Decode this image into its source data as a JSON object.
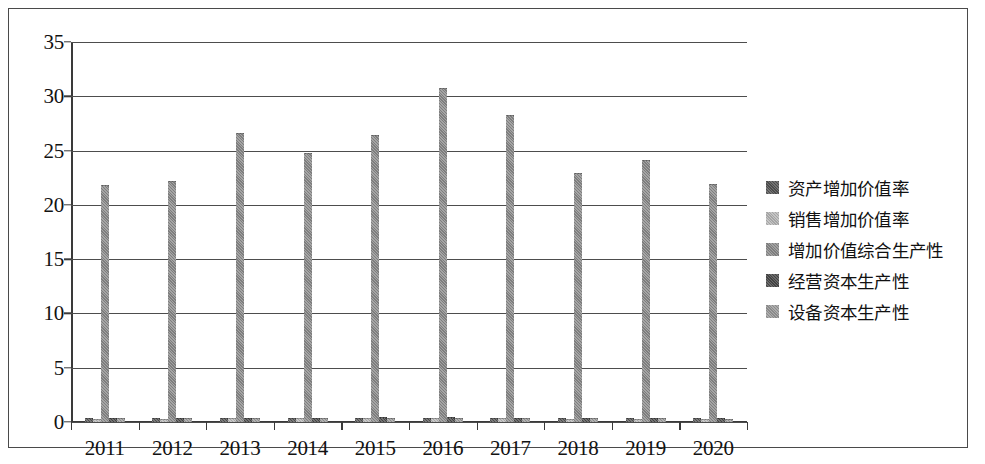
{
  "chart_data": {
    "type": "bar",
    "title": "",
    "subtitle": "",
    "xlabel": "",
    "ylabel": "",
    "grid": true,
    "legend_position": "right",
    "ylim": [
      0,
      35
    ],
    "ytick_step": 5,
    "yticks": [
      "35",
      "30",
      "25",
      "20",
      "15",
      "10",
      "5",
      "0"
    ],
    "categories": [
      "2011",
      "2012",
      "2013",
      "2014",
      "2015",
      "2016",
      "2017",
      "2018",
      "2019",
      "2020"
    ],
    "series": [
      {
        "name": "资产增加价值率",
        "color": "#555555",
        "values": [
          0.25,
          0.25,
          0.3,
          0.3,
          0.3,
          0.3,
          0.28,
          0.26,
          0.26,
          0.25
        ]
      },
      {
        "name": "销售增加价值率",
        "color": "#b8b8b8",
        "values": [
          0.22,
          0.22,
          0.24,
          0.24,
          0.26,
          0.26,
          0.24,
          0.23,
          0.23,
          0.22
        ]
      },
      {
        "name": "增加价值综合生产性",
        "color": "#8c8c8c",
        "values": [
          21.7,
          22.1,
          26.5,
          24.7,
          26.3,
          30.7,
          28.2,
          22.8,
          24.0,
          21.8
        ]
      },
      {
        "name": "经营资本生产性",
        "color": "#4a4a4a",
        "values": [
          0.3,
          0.3,
          0.32,
          0.32,
          0.34,
          0.34,
          0.3,
          0.28,
          0.28,
          0.27
        ]
      },
      {
        "name": "设备资本生产性",
        "color": "#9a9a9a",
        "values": [
          0.24,
          0.24,
          0.26,
          0.26,
          0.28,
          0.28,
          0.26,
          0.24,
          0.24,
          0.23
        ]
      }
    ]
  }
}
